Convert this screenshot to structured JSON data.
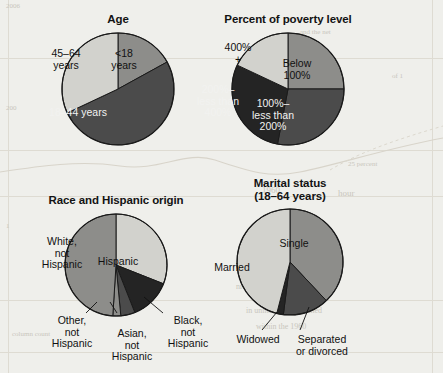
{
  "figure": {
    "background_color": "#efefeb",
    "palette": {
      "light": "#d2d2cd",
      "medium": "#8d8d8a",
      "dark": "#4b4b4b",
      "darkest": "#242424",
      "outline": "#1a1a1a",
      "text_dark": "#111111",
      "text_light": "#f2f2f0"
    }
  },
  "scan_artifacts": {
    "note": "faint reverse-side bleed-through of an underlying printed page",
    "marks": [
      {
        "text": "2006",
        "x": 6,
        "y": 2,
        "size": 7
      },
      {
        "text": "and the net",
        "x": 300,
        "y": 28,
        "size": 7
      },
      {
        "text": "of 1",
        "x": 392,
        "y": 72,
        "size": 7
      },
      {
        "text": "200",
        "x": 6,
        "y": 104,
        "size": 7
      },
      {
        "text": "25 percent",
        "x": 348,
        "y": 160,
        "size": 7
      },
      {
        "text": "1960",
        "x": 262,
        "y": 185,
        "size": 9
      },
      {
        "text": "hour",
        "x": 338,
        "y": 188,
        "size": 9
      },
      {
        "text": "0 two hour",
        "x": 266,
        "y": 212,
        "size": 8
      },
      {
        "text": "1",
        "x": 6,
        "y": 222,
        "size": 7
      },
      {
        "text": "nrollment for the or",
        "x": 236,
        "y": 282,
        "size": 8
      },
      {
        "text": "in uninsurance declined",
        "x": 246,
        "y": 306,
        "size": 8
      },
      {
        "text": "within the 1960",
        "x": 256,
        "y": 322,
        "size": 8
      },
      {
        "text": "column count",
        "x": 12,
        "y": 330,
        "size": 7
      }
    ]
  },
  "charts": [
    {
      "id": "age",
      "title": "Age",
      "type": "pie",
      "center": {
        "x": 118,
        "y": 89
      },
      "radius": 56,
      "slices": [
        {
          "label": "<18\nyears",
          "value": 17.0,
          "tone": "medium",
          "label_pos": {
            "x": 124,
            "y": 48
          },
          "label_color": "dark"
        },
        {
          "label": "18–44 years",
          "value": 51.0,
          "tone": "dark",
          "label_pos": {
            "x": 78,
            "y": 107
          },
          "label_color": "light"
        },
        {
          "label": "45–64\nyears",
          "value": 32.0,
          "tone": "light",
          "label_pos": {
            "x": 66,
            "y": 48
          },
          "label_color": "dark"
        }
      ]
    },
    {
      "id": "poverty",
      "title": "Percent of poverty level",
      "type": "pie",
      "center": {
        "x": 288,
        "y": 89
      },
      "radius": 56,
      "slices": [
        {
          "label": "Below\n100%",
          "value": 25.0,
          "tone": "medium",
          "label_pos": {
            "x": 297,
            "y": 58
          },
          "label_color": "dark"
        },
        {
          "label": "100%–\nless than\n200%",
          "value": 28.0,
          "tone": "dark",
          "label_pos": {
            "x": 273,
            "y": 98
          },
          "label_color": "light"
        },
        {
          "label": "200%–\nless than\n400%",
          "value": 29.0,
          "tone": "darkest",
          "label_pos": {
            "x": 218,
            "y": 84
          },
          "label_color": "light"
        },
        {
          "label": "400%\n+",
          "value": 18.0,
          "tone": "light",
          "label_pos": {
            "x": 238,
            "y": 42
          },
          "label_color": "dark"
        }
      ]
    },
    {
      "id": "race",
      "title": "Race and Hispanic origin",
      "type": "pie",
      "center": {
        "x": 116,
        "y": 265
      },
      "radius": 51,
      "slices": [
        {
          "label": "Hispanic",
          "value": 31.0,
          "tone": "light",
          "label_pos": {
            "x": 118,
            "y": 256
          },
          "label_color": "dark"
        },
        {
          "label": "Black,\nnot\nHispanic",
          "value": 13.0,
          "tone": "darkest",
          "label_pos": null,
          "label_color": "dark"
        },
        {
          "label": "Asian,\nnot\nHispanic",
          "value": 4.5,
          "tone": "dark",
          "label_pos": null,
          "label_color": "dark"
        },
        {
          "label": "Other,\nnot\nHispanic",
          "value": 2.5,
          "tone": "medium",
          "label_pos": null,
          "label_color": "dark"
        },
        {
          "label": "White,\nnot\nHispanic",
          "value": 49.0,
          "tone": "medium",
          "label_pos": {
            "x": 62,
            "y": 236
          },
          "label_color": "dark"
        }
      ],
      "callouts": [
        {
          "text": "Other,\nnot\nHispanic",
          "x": 36,
          "y": 315,
          "line": {
            "x1": 86,
            "y1": 313,
            "x2": 97,
            "y2": 302
          }
        },
        {
          "text": "Asian,\nnot\nHispanic",
          "x": 96,
          "y": 328,
          "line": {
            "x1": 117,
            "y1": 313,
            "x2": 110,
            "y2": 302
          }
        },
        {
          "text": "Black,\nnot\nHispanic",
          "x": 152,
          "y": 315,
          "line": {
            "x1": 163,
            "y1": 313,
            "x2": 144,
            "y2": 297
          }
        }
      ]
    },
    {
      "id": "marital",
      "title": "Marital status\n(18–64 years)",
      "type": "pie",
      "center": {
        "x": 290,
        "y": 262
      },
      "radius": 53,
      "slices": [
        {
          "label": "Single",
          "value": 38.0,
          "tone": "medium",
          "label_pos": {
            "x": 294,
            "y": 238
          },
          "label_color": "dark"
        },
        {
          "label": "Separated\nor divorced",
          "value": 14.0,
          "tone": "dark",
          "label_pos": null,
          "label_color": "dark"
        },
        {
          "label": "Widowed",
          "value": 2.0,
          "tone": "darkest",
          "label_pos": null,
          "label_color": "dark"
        },
        {
          "label": "Married",
          "value": 46.0,
          "tone": "light",
          "label_pos": {
            "x": 232,
            "y": 262
          },
          "label_color": "dark"
        }
      ],
      "callouts": [
        {
          "text": "Widowed",
          "x": 222,
          "y": 334,
          "line": {
            "x1": 262,
            "y1": 330,
            "x2": 277,
            "y2": 312
          }
        },
        {
          "text": "Separated\nor divorced",
          "x": 286,
          "y": 334,
          "line": {
            "x1": 300,
            "y1": 330,
            "x2": 309,
            "y2": 307
          }
        }
      ]
    }
  ],
  "chart_data": [
    {
      "type": "pie",
      "title": "Age",
      "categories": [
        "<18 years",
        "18–44 years",
        "45–64 years"
      ],
      "values": [
        17,
        51,
        32
      ],
      "labels_inside": true,
      "legend": "none",
      "xlabel": "",
      "ylabel": ""
    },
    {
      "type": "pie",
      "title": "Percent of poverty level",
      "categories": [
        "Below 100%",
        "100%–less than 200%",
        "200%–less than 400%",
        "400% +"
      ],
      "values": [
        25,
        28,
        29,
        18
      ],
      "labels_inside": true,
      "legend": "none",
      "xlabel": "",
      "ylabel": ""
    },
    {
      "type": "pie",
      "title": "Race and Hispanic origin",
      "categories": [
        "Hispanic",
        "Black, not Hispanic",
        "Asian, not Hispanic",
        "Other, not Hispanic",
        "White, not Hispanic"
      ],
      "values": [
        31,
        13,
        4.5,
        2.5,
        49
      ],
      "labels_inside": false,
      "legend": "callout labels",
      "xlabel": "",
      "ylabel": ""
    },
    {
      "type": "pie",
      "title": "Marital status (18–64 years)",
      "categories": [
        "Single",
        "Separated or divorced",
        "Widowed",
        "Married"
      ],
      "values": [
        38,
        14,
        2,
        46
      ],
      "labels_inside": false,
      "legend": "callout labels",
      "xlabel": "",
      "ylabel": ""
    }
  ]
}
